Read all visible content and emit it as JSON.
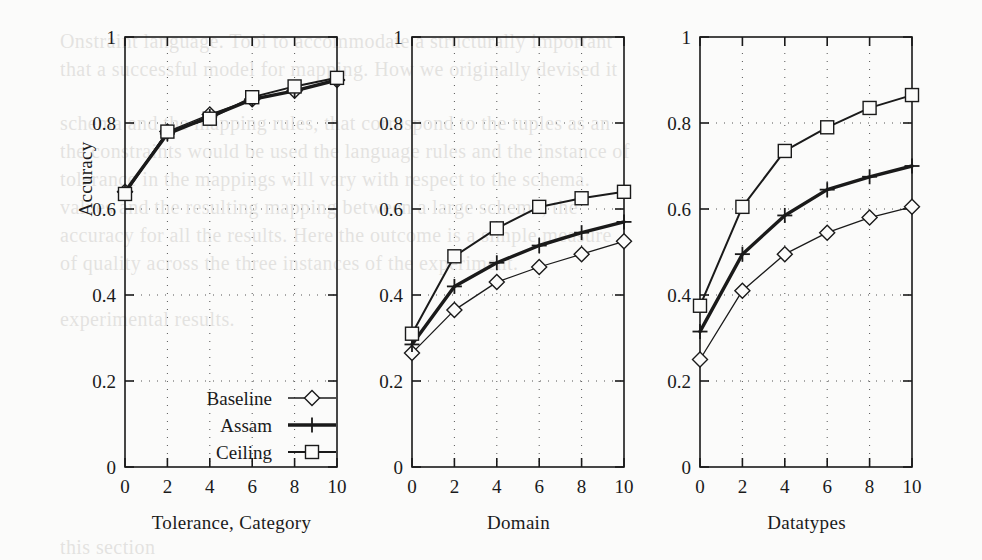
{
  "figure": {
    "background_color": "#fbfbfa",
    "ink_color": "#1a1a1a",
    "ylabel": "Accuracy",
    "yticks": [
      "0",
      "0.2",
      "0.4",
      "0.6",
      "0.8",
      "1"
    ],
    "xticks": [
      "0",
      "2",
      "4",
      "6",
      "8",
      "10"
    ]
  },
  "legend": {
    "position": "bottom-left of first panel",
    "entries": [
      {
        "label": "Baseline",
        "marker": "diamond",
        "line_weight": "thin"
      },
      {
        "label": "Assam",
        "marker": "plus",
        "line_weight": "thick"
      },
      {
        "label": "Ceiling",
        "marker": "square",
        "line_weight": "medium"
      }
    ]
  },
  "bleed_text": [
    {
      "x": 60,
      "y": 30,
      "text": "Onstraint language.  Tool to accommodate a structurally important"
    },
    {
      "x": 60,
      "y": 58,
      "text": "that a successful model for mapping.  How we originally devised it"
    },
    {
      "x": 60,
      "y": 112,
      "text": "schema and the mapping rules, that correspond to the tuples as an"
    },
    {
      "x": 60,
      "y": 140,
      "text": "the constraints would be used the language rules and the instance of"
    },
    {
      "x": 60,
      "y": 168,
      "text": "tolerance in the mappings will vary with respect to the schema."
    },
    {
      "x": 60,
      "y": 196,
      "text": "values and the resulting mapping between a large schema, the"
    },
    {
      "x": 60,
      "y": 224,
      "text": "accuracy for all the results.  Here the outcome is a simple measure"
    },
    {
      "x": 60,
      "y": 252,
      "text": "of quality across the three instances of the experiment."
    },
    {
      "x": 60,
      "y": 308,
      "text": "experimental results."
    },
    {
      "x": 60,
      "y": 536,
      "text": "this section"
    }
  ],
  "chart_data": [
    {
      "type": "line",
      "panel": 1,
      "title": "",
      "xlabel": "Tolerance, Category",
      "ylabel": "Accuracy",
      "x": [
        0,
        2,
        4,
        6,
        8,
        10
      ],
      "xlim": [
        0,
        10
      ],
      "ylim": [
        0,
        1
      ],
      "grid": true,
      "series": [
        {
          "name": "Baseline",
          "marker": "diamond",
          "values": [
            0.64,
            0.78,
            0.82,
            0.855,
            0.875,
            0.9
          ]
        },
        {
          "name": "Assam",
          "marker": "plus",
          "values": [
            0.64,
            0.775,
            0.815,
            0.855,
            0.875,
            0.9
          ]
        },
        {
          "name": "Ceiling",
          "marker": "square",
          "values": [
            0.635,
            0.78,
            0.81,
            0.86,
            0.885,
            0.905
          ]
        }
      ]
    },
    {
      "type": "line",
      "panel": 2,
      "title": "",
      "xlabel": "Domain",
      "ylabel": "Accuracy",
      "x": [
        0,
        2,
        4,
        6,
        8,
        10
      ],
      "xlim": [
        0,
        10
      ],
      "ylim": [
        0,
        1
      ],
      "grid": true,
      "series": [
        {
          "name": "Baseline",
          "marker": "diamond",
          "values": [
            0.265,
            0.365,
            0.43,
            0.465,
            0.495,
            0.525
          ]
        },
        {
          "name": "Assam",
          "marker": "plus",
          "values": [
            0.285,
            0.42,
            0.475,
            0.515,
            0.545,
            0.57
          ]
        },
        {
          "name": "Ceiling",
          "marker": "square",
          "values": [
            0.31,
            0.49,
            0.555,
            0.605,
            0.625,
            0.64
          ]
        }
      ]
    },
    {
      "type": "line",
      "panel": 3,
      "title": "",
      "xlabel": "Datatypes",
      "ylabel": "Accuracy",
      "x": [
        0,
        2,
        4,
        6,
        8,
        10
      ],
      "xlim": [
        0,
        10
      ],
      "ylim": [
        0,
        1
      ],
      "grid": true,
      "series": [
        {
          "name": "Baseline",
          "marker": "diamond",
          "values": [
            0.25,
            0.41,
            0.495,
            0.545,
            0.58,
            0.605
          ]
        },
        {
          "name": "Assam",
          "marker": "plus",
          "values": [
            0.315,
            0.495,
            0.585,
            0.645,
            0.675,
            0.7
          ]
        },
        {
          "name": "Ceiling",
          "marker": "square",
          "values": [
            0.375,
            0.605,
            0.735,
            0.79,
            0.835,
            0.865
          ]
        }
      ]
    }
  ]
}
